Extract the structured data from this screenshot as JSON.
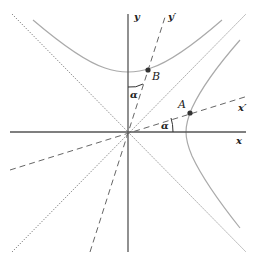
{
  "diagram": {
    "type": "hyperbola-rotated-axes",
    "colors": {
      "axis": "#555555",
      "dashed": "#666666",
      "dotted": "#777777",
      "hyperbola": "#aaaaaa",
      "point": "#333333",
      "text": "#222222"
    },
    "labels": {
      "y_axis": "y",
      "y_prime": "y′",
      "x_axis": "x",
      "x_prime": "x′",
      "point_a": "A",
      "point_b": "B",
      "angle_top": "α",
      "angle_right": "α"
    },
    "elements": [
      "x-axis",
      "y-axis",
      "x-prime-axis (dashed)",
      "y-prime-axis (dashed)",
      "asymptote y=x (dotted)",
      "asymptote y=-x (dotted)",
      "upper hyperbola branch",
      "right hyperbola branch",
      "point A on right branch and x′",
      "point B on upper branch and y′",
      "angle α between y and y′",
      "angle α between x and x′"
    ]
  }
}
